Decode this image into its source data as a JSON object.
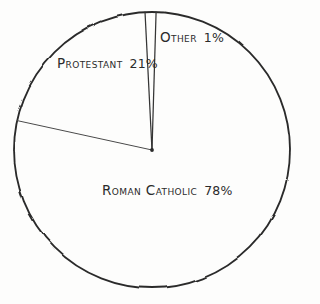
{
  "chart_data": {
    "type": "pie",
    "title": "",
    "subtitle": "",
    "xlabel": "",
    "ylabel": "",
    "legend_position": "none",
    "grid": false,
    "style": "hand-drawn",
    "labels_inside": true,
    "categories": [
      "Roman Catholic",
      "Protestant",
      "Other"
    ],
    "values": [
      78,
      21,
      1
    ],
    "unit": "%",
    "slices": [
      {
        "name": "Roman Catholic",
        "value": 78,
        "label": "Roman Catholic",
        "percent_text": "78%",
        "start_angle_deg": 1.7,
        "end_angle_deg": 282.3,
        "fill": "none",
        "stroke": "#2b2b2b"
      },
      {
        "name": "Protestant",
        "value": 21,
        "label": "Protestant",
        "percent_text": "21%",
        "start_angle_deg": 282.3,
        "end_angle_deg": 357.1,
        "fill": "none",
        "stroke": "#2b2b2b"
      },
      {
        "name": "Other",
        "value": 1,
        "label": "Other",
        "percent_text": "1%",
        "start_angle_deg": 357.1,
        "end_angle_deg": 361.7,
        "fill": "none",
        "stroke": "#2b2b2b"
      }
    ],
    "geometry": {
      "center_x": 152,
      "center_y": 150,
      "radius": 138
    },
    "colors": {
      "background": "#fdfdfc",
      "outline": "#2b2b2b",
      "divider": "#3a3a3a",
      "text": "#2b2b2b"
    }
  },
  "labels": {
    "other": {
      "name": "Other",
      "percent": "1%"
    },
    "protestant": {
      "name": "Protestant",
      "percent": "21%"
    },
    "roman_catholic": {
      "name": "Roman Catholic",
      "percent": "78%"
    }
  }
}
